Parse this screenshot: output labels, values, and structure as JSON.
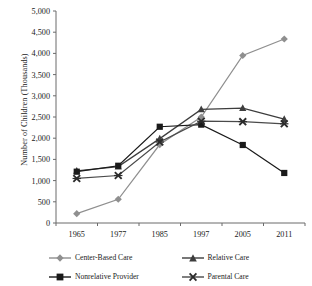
{
  "chart_data": {
    "type": "line",
    "title": "",
    "xlabel": "",
    "ylabel": "Number of Children (Thousands)",
    "categories": [
      "1965",
      "1977",
      "1985",
      "1997",
      "2005",
      "2011"
    ],
    "ylim": [
      0,
      5000
    ],
    "ytick_step": 500,
    "ytick_labels": [
      "0",
      "500",
      "1,000",
      "1,500",
      "2,000",
      "2,500",
      "3,000",
      "3,500",
      "4,000",
      "4,500",
      "5,000"
    ],
    "grid": false,
    "legend_position": "bottom",
    "series": [
      {
        "name": "Center-Based Care",
        "marker": "diamond",
        "color": "#8f8f8f",
        "values": [
          220,
          560,
          1850,
          2500,
          3950,
          4340
        ]
      },
      {
        "name": "Relative Care",
        "marker": "triangle",
        "color": "#3d3d3d",
        "values": [
          1230,
          1330,
          1990,
          2680,
          2710,
          2450
        ]
      },
      {
        "name": "Nonrelative Provider",
        "marker": "square",
        "color": "#1a1a1a",
        "values": [
          1210,
          1350,
          2270,
          2320,
          1840,
          1180
        ]
      },
      {
        "name": "Parental Care",
        "marker": "x-cross",
        "color": "#4a4a4a",
        "values": [
          1050,
          1120,
          1910,
          2400,
          2390,
          2340
        ]
      }
    ]
  },
  "legend": {
    "items": [
      {
        "label": "Center-Based Care",
        "marker": "diamond",
        "color": "#8f8f8f"
      },
      {
        "label": "Relative Care",
        "marker": "triangle",
        "color": "#3d3d3d"
      },
      {
        "label": "Nonrelative Provider",
        "marker": "square",
        "color": "#1a1a1a"
      },
      {
        "label": "Parental Care",
        "marker": "x-cross",
        "color": "#4a4a4a"
      }
    ]
  },
  "axes": {
    "line_color": "#6b6b6b",
    "tick_color": "#6b6b6b",
    "label_color": "#1a1a1a"
  }
}
